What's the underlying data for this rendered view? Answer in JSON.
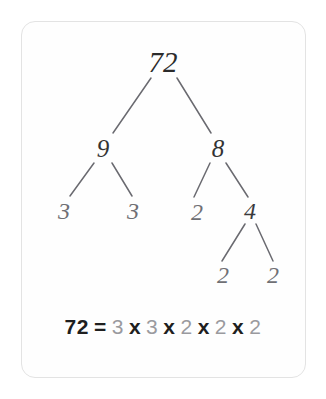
{
  "card": {
    "background_color": "#fefefe",
    "border_color": "#e3e3e3"
  },
  "diagram": {
    "type": "factor-tree",
    "number": "72",
    "nodes": {
      "root": {
        "label": "72",
        "x": 163,
        "y": 62
      },
      "left": {
        "label": "9",
        "x": 103,
        "y": 148
      },
      "right": {
        "label": "8",
        "x": 218,
        "y": 148
      },
      "left_leaf_1": {
        "label": "3",
        "x": 64,
        "y": 211
      },
      "left_leaf_2": {
        "label": "3",
        "x": 133,
        "y": 211
      },
      "right_leaf_1": {
        "label": "2",
        "x": 197,
        "y": 212
      },
      "right_mid": {
        "label": "4",
        "x": 250,
        "y": 211
      },
      "right_leaf_2": {
        "label": "2",
        "x": 223,
        "y": 275
      },
      "right_leaf_3": {
        "label": "2",
        "x": 273,
        "y": 275
      }
    },
    "edges": [
      {
        "from": "root",
        "to": "left"
      },
      {
        "from": "root",
        "to": "right"
      },
      {
        "from": "left",
        "to": "left_leaf_1"
      },
      {
        "from": "left",
        "to": "left_leaf_2"
      },
      {
        "from": "right",
        "to": "right_leaf_1"
      },
      {
        "from": "right",
        "to": "right_mid"
      },
      {
        "from": "right_mid",
        "to": "right_leaf_2"
      },
      {
        "from": "right_mid",
        "to": "right_leaf_3"
      }
    ],
    "edge_color": "#6a6a70"
  },
  "equation": {
    "result": "72",
    "equals": "=",
    "operator": "x",
    "factors": [
      "3",
      "3",
      "2",
      "2",
      "2"
    ],
    "full_text": "72 = 3 x 3 x 2 x 2 x 2"
  }
}
